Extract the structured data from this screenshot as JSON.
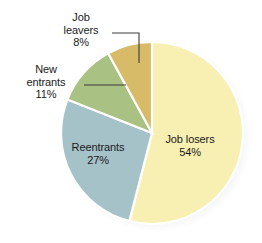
{
  "chart_data": {
    "type": "pie",
    "title": "",
    "subtitle": "",
    "xlabel": "",
    "ylabel": "",
    "legend_position": "none",
    "grid": false,
    "labels_inside": [
      "Job losers",
      "Reentrants"
    ],
    "labels_callout": [
      "Job leavers",
      "New entrants"
    ],
    "start_angle_deg": 0,
    "direction": "clockwise",
    "categories": [
      "Job losers",
      "Reentrants",
      "New entrants",
      "Job leavers"
    ],
    "values": [
      54,
      27,
      11,
      8
    ],
    "value_suffix": "%",
    "slices": [
      {
        "name": "Job losers",
        "label": "Job losers",
        "value": 54,
        "value_text": "54%",
        "color": "#F7F0B2",
        "label_placement": "inside",
        "start_deg": 0,
        "end_deg": 194.4
      },
      {
        "name": "Reentrants",
        "label": "Reentrants",
        "value": 27,
        "value_text": "27%",
        "color": "#A6C2C9",
        "label_placement": "inside",
        "start_deg": 194.4,
        "end_deg": 291.6
      },
      {
        "name": "New entrants",
        "label": "New entrants",
        "value": 11,
        "value_text": "11%",
        "color": "#A9C182",
        "label_placement": "callout-left",
        "start_deg": 291.6,
        "end_deg": 331.2
      },
      {
        "name": "Job leavers",
        "label": "Job leavers",
        "value": 8,
        "value_text": "8%",
        "color": "#D7BB69",
        "label_placement": "callout-top",
        "start_deg": 331.2,
        "end_deg": 360
      }
    ]
  },
  "labels": {
    "job_leavers": {
      "line1": "Job",
      "line2": "leavers",
      "line3": "8%"
    },
    "new_entrants": {
      "line1": "New",
      "line2": "entrants",
      "line3": "11%"
    },
    "reentrants": {
      "line1": "Reentrants",
      "line2": "27%"
    },
    "job_losers": {
      "line1": "Job losers",
      "line2": "54%"
    }
  },
  "style": {
    "background": "#ffffff",
    "separator_color": "#ffffff",
    "text_color": "#1a1a1a",
    "leader_line_color": "#3a3a3a"
  }
}
